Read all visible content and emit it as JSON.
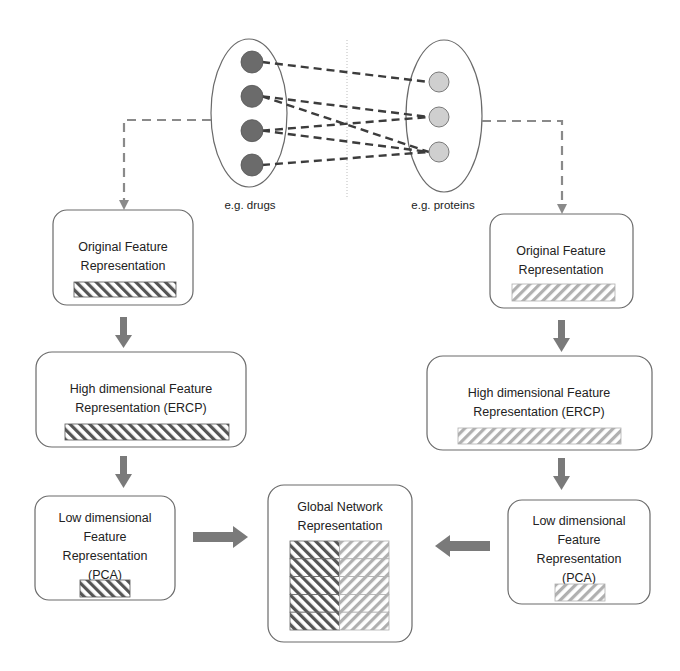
{
  "network": {
    "left_set_label": "e.g. drugs",
    "right_set_label": "e.g. proteins",
    "left_node_count": 4,
    "right_node_count": 3,
    "edges": [
      [
        0,
        0
      ],
      [
        1,
        1
      ],
      [
        1,
        2
      ],
      [
        2,
        1
      ],
      [
        2,
        2
      ],
      [
        3,
        2
      ]
    ],
    "left_node_color": "#6b6b6b",
    "right_node_color": "#cfcfcf"
  },
  "left_pipeline": {
    "original": [
      "Original Feature",
      "Representation"
    ],
    "high": [
      "High dimensional Feature",
      "Representation (ERCP)"
    ],
    "low": [
      "Low dimensional",
      "Feature",
      "Representation",
      "(PCA)"
    ],
    "hatch_color": "#555555"
  },
  "right_pipeline": {
    "original": [
      "Original Feature",
      "Representation"
    ],
    "high": [
      "High dimensional Feature",
      "Representation (ERCP)"
    ],
    "low": [
      "Low dimensional",
      "Feature",
      "Representation",
      "(PCA)"
    ],
    "hatch_color": "#b0b0b0"
  },
  "global": {
    "label": [
      "Global Network",
      "Representation"
    ],
    "rows": 5
  },
  "colors": {
    "box_border": "#6a6a6a",
    "arrow": "#7a7a7a",
    "text": "#222222"
  }
}
